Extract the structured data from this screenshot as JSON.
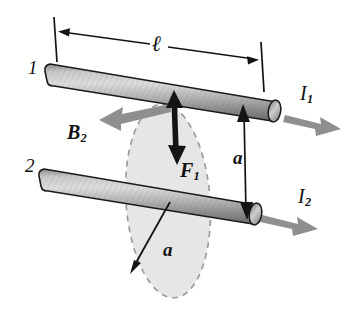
{
  "figure": {
    "background_color": "#ffffff",
    "ink_color": "#121212",
    "current_arrow_color": "#8f8f8f",
    "field_arrow_color": "#8f8f8f",
    "force_arrow_color": "#141414",
    "ellipse_fill_color": "#e2e2e2",
    "ellipse_stroke_color": "#9a9a9a",
    "rod_light_color": "#d8d8d8",
    "rod_mid_color": "#a9a9a9",
    "rod_dark_color": "#6e6e6e",
    "rod_outline_color": "#1a1a1a"
  },
  "labels": {
    "rod1_number": "1",
    "rod2_number": "2",
    "length_symbol": "ℓ",
    "separation_symbol": "a",
    "radius_symbol": "a",
    "field_vector": "B",
    "field_vector_sub": "2",
    "force_vector": "F",
    "force_vector_sub": "1",
    "current1": "I",
    "current1_sub": "1",
    "current2": "I",
    "current2_sub": "2"
  },
  "annotations": {
    "length_dimension": {
      "name": "rod-length",
      "symbol": "ℓ",
      "style": "double-headed arrow between two tick marks above rod 1"
    },
    "separation_dimension": {
      "name": "rod-separation",
      "symbol": "a",
      "style": "vertical double-headed arrow from rod 1 down to rod 2"
    },
    "circle_radius_dimension": {
      "name": "field-circle-radius",
      "symbol": "a",
      "style": "arrow from center of circle to its dashed edge"
    },
    "magnetic_field": {
      "name": "magnetic-field-B2",
      "symbol": "B₂",
      "direction": "left, tangent to the field circle at rod 1",
      "color": "#8f8f8f"
    },
    "force": {
      "name": "force-F1",
      "symbol": "F₁",
      "direction": "downward from rod 1 toward rod 2",
      "color": "#141414"
    },
    "current_rod1": {
      "name": "current-I1",
      "symbol": "I₁",
      "direction": "right"
    },
    "current_rod2": {
      "name": "current-I2",
      "symbol": "I₂",
      "direction": "right"
    },
    "field_circle": {
      "name": "field-circle",
      "style": "dashed ellipse, shaded, centered on rod 2, perpendicular to rod 2"
    }
  }
}
